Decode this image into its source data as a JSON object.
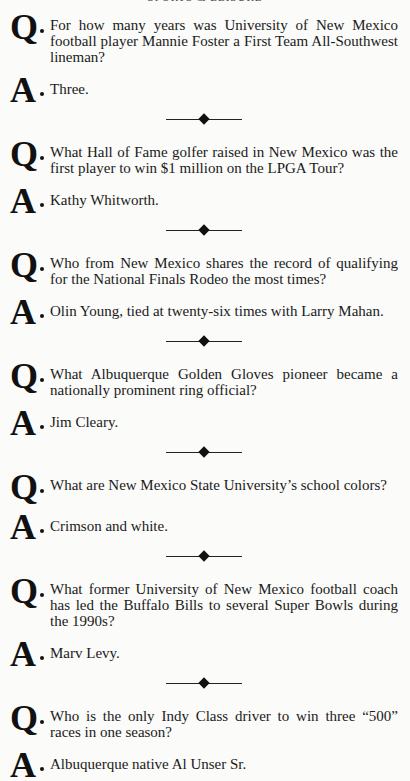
{
  "running_head": "SPORTS & LEISURE",
  "q_marker": "Q",
  "a_marker": "A",
  "items": [
    {
      "question": "For how many years was University of New Mexico football player Mannie Foster a First Team All-Southwest lineman?",
      "answer": "Three."
    },
    {
      "question": "What Hall of Fame golfer raised in New Mexico was the first player to win $1 million on the LPGA Tour?",
      "answer": "Kathy Whitworth."
    },
    {
      "question": "Who from New Mexico shares the record of qualifying for the National Finals Rodeo the most times?",
      "answer": "Olin Young, tied at twenty-six times with Larry Mahan."
    },
    {
      "question": "What Albuquerque Golden Gloves pioneer became a nationally prominent ring official?",
      "answer": "Jim Cleary."
    },
    {
      "question": "What are New Mexico State University’s school colors?",
      "answer": "Crimson and white."
    },
    {
      "question": "What former University of New Mexico football coach has led the Buffalo Bills to several Super Bowls during the 1990s?",
      "answer": "Marv Levy."
    },
    {
      "question": "Who is the only Indy Class driver to win three “500” races in one season?",
      "answer": "Albuquerque native Al Unser Sr."
    }
  ]
}
